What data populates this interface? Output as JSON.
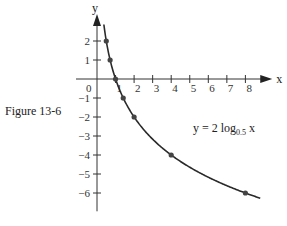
{
  "figure_caption": "Figure 13-6",
  "chart_data": {
    "type": "line",
    "title": "",
    "xlabel": "x",
    "ylabel": "y",
    "xlim": [
      0,
      8.8
    ],
    "ylim": [
      -6.7,
      2.9
    ],
    "grid": false,
    "x_ticks": [
      1,
      2,
      3,
      4,
      5,
      6,
      7,
      8
    ],
    "y_ticks": [
      2,
      1,
      -1,
      -2,
      -3,
      -4,
      -5,
      -6
    ],
    "origin_label": "0",
    "series": [
      {
        "name": "y = 2 log0.5 x",
        "function": "2*log(x)/log(0.5)",
        "x_range": [
          0.37,
          8.8
        ],
        "marked_points": [
          {
            "x": 0.5,
            "y": 2
          },
          {
            "x": 0.7071,
            "y": 1
          },
          {
            "x": 1,
            "y": 0
          },
          {
            "x": 1.4142,
            "y": -1
          },
          {
            "x": 2,
            "y": -2
          },
          {
            "x": 4,
            "y": -4
          },
          {
            "x": 8,
            "y": -6
          }
        ]
      }
    ],
    "annotations": [
      {
        "text_main": "y = 2 log",
        "text_sub": "0.5",
        "text_tail": " x"
      }
    ]
  }
}
